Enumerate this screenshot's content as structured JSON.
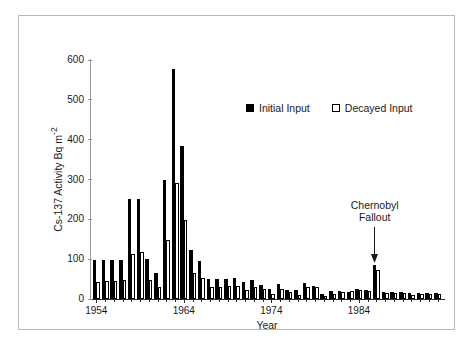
{
  "chart_data": {
    "type": "bar",
    "title": "",
    "subtitle": "",
    "xlabel": "Year",
    "ylabel": "Cs-137 Activity Bq m-2",
    "ylabel_display": "Cs-137 Activity Bq m",
    "ylabel_superscript": "-2",
    "xlim": [
      1953.4,
      1993.6
    ],
    "ylim": [
      0,
      600
    ],
    "ytick_labels": [
      "0",
      "100",
      "200",
      "300",
      "400",
      "500",
      "600"
    ],
    "ytick_values": [
      0,
      100,
      200,
      300,
      400,
      500,
      600
    ],
    "xtick_labels": [
      "1954",
      "1964",
      "1974",
      "1984"
    ],
    "xtick_values": [
      1954,
      1964,
      1974,
      1984
    ],
    "xtick_minor_step": 1,
    "grid": false,
    "legend_position": "upper-center-right",
    "categories": [
      1954,
      1955,
      1956,
      1957,
      1958,
      1959,
      1960,
      1961,
      1962,
      1963,
      1964,
      1965,
      1966,
      1967,
      1968,
      1969,
      1970,
      1971,
      1972,
      1973,
      1974,
      1975,
      1976,
      1977,
      1978,
      1979,
      1980,
      1981,
      1982,
      1983,
      1984,
      1985,
      1986,
      1987,
      1988,
      1989,
      1990,
      1991,
      1992,
      1993
    ],
    "series": [
      {
        "name": "Initial Input",
        "color": "#000000",
        "style": "filled",
        "values": [
          99,
          98,
          98,
          98,
          250,
          250,
          100,
          65,
          300,
          578,
          385,
          122,
          96,
          51,
          49,
          49,
          54,
          42,
          48,
          34,
          25,
          37,
          22,
          22,
          41,
          33,
          12,
          21,
          19,
          18,
          24,
          23,
          86,
          17,
          17,
          17,
          15,
          14,
          14,
          14
        ]
      },
      {
        "name": "Decayed Input",
        "color": "#ffffff",
        "style": "open",
        "values": [
          42,
          45,
          45,
          47,
          113,
          118,
          48,
          31,
          147,
          290,
          198,
          66,
          53,
          29,
          30,
          33,
          32,
          22,
          31,
          26,
          13,
          24,
          17,
          11,
          30,
          31,
          8,
          12,
          18,
          19,
          22,
          21,
          72,
          16,
          16,
          15,
          11,
          12,
          12,
          12
        ]
      }
    ],
    "annotations": [
      {
        "name": "chernobyl-fallout",
        "text_line1": "Chernobyl",
        "text_line2": "Fallout",
        "points_to_year": 1986,
        "arrow": "down"
      }
    ]
  },
  "legend": {
    "entries": [
      {
        "label": "Initial Input",
        "swatch": "filled-square-icon"
      },
      {
        "label": "Decayed Input",
        "swatch": "open-square-icon"
      }
    ]
  },
  "colors": {
    "initial": "#000000",
    "decayed": "#ffffff",
    "axis": "#2b2b2b",
    "frame": "#b9b9b9",
    "background": "#ffffff"
  }
}
